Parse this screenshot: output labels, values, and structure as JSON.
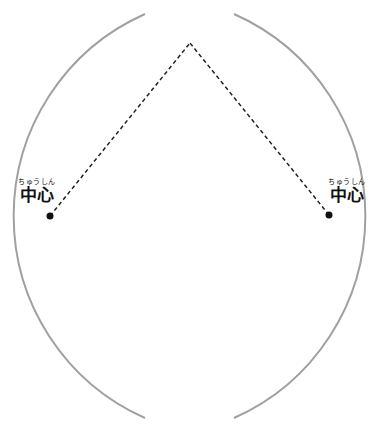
{
  "diagram": {
    "left_label": {
      "ruby": "ちゅうしん",
      "text": "中心"
    },
    "right_label": {
      "ruby": "ちゅうしん",
      "text": "中心"
    },
    "colors": {
      "arc": "#a0a0a0",
      "dash": "#222222",
      "dot": "#111111"
    },
    "points": {
      "left_center": [
        50,
        216
      ],
      "right_center": [
        329,
        215
      ],
      "top_intersection": [
        190,
        43
      ],
      "bottom_intersection": [
        191,
        391
      ]
    }
  }
}
